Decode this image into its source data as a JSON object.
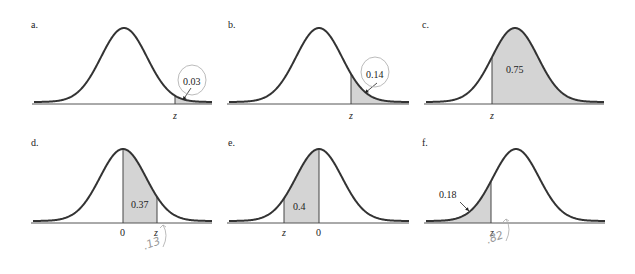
{
  "figure": {
    "colors": {
      "curve": "#333333",
      "shade": "#d4d4d4",
      "axis": "#555555",
      "annotation": "#aaaaaa"
    }
  },
  "panels": [
    {
      "id": "a",
      "label": "a.",
      "shade": "right_tail",
      "area_label": "0.03",
      "z_label": "z",
      "zero_label": "",
      "arrow": true,
      "circled": true,
      "handwritten": ""
    },
    {
      "id": "b",
      "label": "b.",
      "shade": "right_tail",
      "area_label": "0.14",
      "z_label": "z",
      "zero_label": "",
      "arrow": true,
      "circled": true,
      "handwritten": ""
    },
    {
      "id": "c",
      "label": "c.",
      "shade": "right_of_z",
      "area_label": "0.75",
      "z_label": "z",
      "zero_label": "",
      "arrow": false,
      "circled": false,
      "handwritten": ""
    },
    {
      "id": "d",
      "label": "d.",
      "shade": "zero_to_z",
      "area_label": "0.37",
      "z_label": "z",
      "zero_label": "0",
      "arrow": false,
      "circled": false,
      "handwritten": ".13"
    },
    {
      "id": "e",
      "label": "e.",
      "shade": "z_to_zero",
      "area_label": "0.4",
      "z_label": "z",
      "zero_label": "0",
      "arrow": false,
      "circled": false,
      "handwritten": ""
    },
    {
      "id": "f",
      "label": "f.",
      "shade": "left_tail",
      "area_label": "0.18",
      "z_label": "z",
      "zero_label": "",
      "arrow": true,
      "circled": false,
      "handwritten": ".82"
    }
  ],
  "chart_data": [
    {
      "type": "area",
      "title": "a.",
      "distribution": "standard normal",
      "shaded_region": "right tail beyond z",
      "area": 0.03,
      "xlabels": [
        "z"
      ]
    },
    {
      "type": "area",
      "title": "b.",
      "distribution": "standard normal",
      "shaded_region": "right tail beyond z",
      "area": 0.14,
      "xlabels": [
        "z"
      ]
    },
    {
      "type": "area",
      "title": "c.",
      "distribution": "standard normal",
      "shaded_region": "right of z",
      "area": 0.75,
      "xlabels": [
        "z"
      ]
    },
    {
      "type": "area",
      "title": "d.",
      "distribution": "standard normal",
      "shaded_region": "between 0 and z",
      "area": 0.37,
      "xlabels": [
        "0",
        "z"
      ],
      "annotation": ".13"
    },
    {
      "type": "area",
      "title": "e.",
      "distribution": "standard normal",
      "shaded_region": "between z and 0",
      "area": 0.4,
      "xlabels": [
        "z",
        "0"
      ]
    },
    {
      "type": "area",
      "title": "f.",
      "distribution": "standard normal",
      "shaded_region": "left tail below z",
      "area": 0.18,
      "xlabels": [
        "z"
      ],
      "annotation": ".82"
    }
  ],
  "layout": {
    "panels": [
      {
        "left": 0,
        "top": 0,
        "cx": 124,
        "base": 104,
        "peak": 28,
        "sigma": 23,
        "xmin": 34,
        "xmax": 212,
        "z": 175,
        "zero": null,
        "label_pos": [
          31,
          19
        ],
        "area_pos": [
          183,
          76
        ],
        "z_pos": [
          173,
          110
        ],
        "zero_pos": null,
        "arrow": [
          [
            191,
            88
          ],
          [
            183,
            100
          ]
        ],
        "circle": [
          192,
          80,
          14,
          15
        ],
        "hand_pos": null
      },
      {
        "left": 212,
        "top": 0,
        "cx": 107,
        "base": 104,
        "peak": 28,
        "sigma": 23,
        "xmin": 17,
        "xmax": 197,
        "z": 139,
        "zero": null,
        "label_pos": [
          16,
          19
        ],
        "area_pos": [
          154,
          69
        ],
        "z_pos": [
          137,
          110
        ],
        "zero_pos": null,
        "arrow": [
          [
            165,
            83
          ],
          [
            153,
            93
          ]
        ],
        "circle": [
          163,
          72,
          14,
          15
        ],
        "hand_pos": null
      },
      {
        "left": 424,
        "top": 0,
        "cx": 91,
        "base": 104,
        "peak": 28,
        "sigma": 23,
        "xmin": 2,
        "xmax": 180,
        "z": 68,
        "zero": null,
        "label_pos": [
          -2,
          19
        ],
        "area_pos": [
          82,
          64
        ],
        "z_pos": [
          66,
          110
        ],
        "zero_pos": null,
        "arrow": null,
        "circle": null,
        "hand_pos": null
      },
      {
        "left": 0,
        "top": 137,
        "cx": 123,
        "base": 86,
        "peak": 12,
        "sigma": 23,
        "xmin": 33,
        "xmax": 212,
        "z": 157,
        "zero": 123,
        "label_pos": [
          31,
          0
        ],
        "area_pos": [
          131,
          62
        ],
        "z_pos": [
          154,
          90
        ],
        "zero_pos": [
          120,
          90
        ],
        "arrow": null,
        "circle": null,
        "hand_pos": [
          155,
          102
        ]
      },
      {
        "left": 212,
        "top": 137,
        "cx": 107,
        "base": 86,
        "peak": 12,
        "sigma": 23,
        "xmin": 17,
        "xmax": 197,
        "z": 72,
        "zero": 107,
        "label_pos": [
          16,
          0
        ],
        "area_pos": [
          81,
          64
        ],
        "z_pos": [
          70,
          90
        ],
        "zero_pos": [
          104,
          90
        ],
        "arrow": null,
        "circle": null,
        "hand_pos": null
      },
      {
        "left": 424,
        "top": 137,
        "cx": 92,
        "base": 86,
        "peak": 12,
        "sigma": 23,
        "xmin": 2,
        "xmax": 181,
        "z": 67,
        "zero": null,
        "label_pos": [
          -2,
          0
        ],
        "area_pos": [
          15,
          52
        ],
        "z_pos": [
          66,
          90
        ],
        "zero_pos": null,
        "arrow": [
          [
            36,
            65
          ],
          [
            45,
            74
          ]
        ],
        "circle": null,
        "hand_pos": [
          74,
          96
        ]
      }
    ]
  }
}
